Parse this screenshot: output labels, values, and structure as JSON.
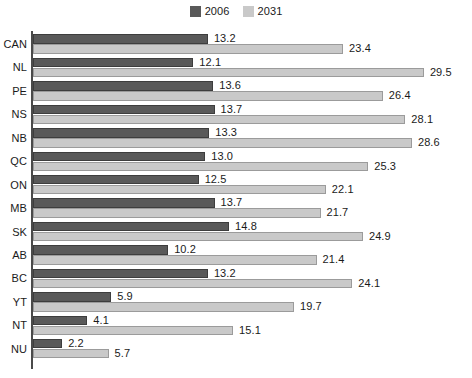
{
  "legend": {
    "position": "top-center",
    "entries": [
      {
        "label": "2006",
        "color": "#595959",
        "icon": "legend-swatch-icon"
      },
      {
        "label": "2031",
        "color": "#c9c9c9",
        "icon": "legend-swatch-icon"
      }
    ]
  },
  "chart_data": {
    "type": "bar",
    "orientation": "horizontal",
    "title": "",
    "subtitle": "",
    "xlabel": "",
    "ylabel": "",
    "xlim": [
      0,
      32
    ],
    "ylim": null,
    "grid": false,
    "legend_position": "top-center",
    "categories": [
      "CAN",
      "NL",
      "PE",
      "NS",
      "NB",
      "QC",
      "ON",
      "MB",
      "SK",
      "AB",
      "BC",
      "YT",
      "NT",
      "NU"
    ],
    "series": [
      {
        "name": "2006",
        "color": "#595959",
        "values": [
          13.2,
          12.1,
          13.6,
          13.7,
          13.3,
          13.0,
          12.5,
          13.7,
          14.8,
          10.2,
          13.2,
          5.9,
          4.1,
          2.2
        ]
      },
      {
        "name": "2031",
        "color": "#c9c9c9",
        "values": [
          23.4,
          29.5,
          26.4,
          28.1,
          28.6,
          25.3,
          22.1,
          21.7,
          24.9,
          21.4,
          24.1,
          19.7,
          15.1,
          5.7
        ]
      }
    ],
    "data_labels": {
      "2006": [
        "13.2",
        "12.1",
        "13.6",
        "13.7",
        "13.3",
        "13.0",
        "12.5",
        "13.7",
        "14.8",
        "10.2",
        "13.2",
        "5.9",
        "4.1",
        "2.2"
      ],
      "2031": [
        "23.4",
        "29.5",
        "26.4",
        "28.1",
        "28.6",
        "25.3",
        "22.1",
        "21.7",
        "24.9",
        "21.4",
        "24.1",
        "19.7",
        "15.1",
        "5.7"
      ]
    }
  },
  "colors": {
    "series_2006": "#595959",
    "series_2031": "#c9c9c9",
    "axis": "#4a4a4a",
    "text": "#1a1a1a",
    "background": "#ffffff"
  }
}
